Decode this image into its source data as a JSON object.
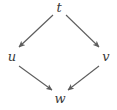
{
  "diagram": {
    "type": "commutative-square",
    "background_color": "#ffffff",
    "stroke_color": "#5d5d5d",
    "label_color": "#3a3a3a",
    "nodes": [
      {
        "id": "t",
        "label": "t",
        "position": "top",
        "x": 59,
        "y": 8
      },
      {
        "id": "u",
        "label": "u",
        "position": "left",
        "x": 12,
        "y": 57
      },
      {
        "id": "v",
        "label": "v",
        "position": "right",
        "x": 106,
        "y": 57
      },
      {
        "id": "w",
        "label": "w",
        "position": "bottom",
        "x": 60,
        "y": 99
      }
    ],
    "edges": [
      {
        "from": "t",
        "to": "u",
        "arrowhead": "to",
        "label": ""
      },
      {
        "from": "t",
        "to": "v",
        "arrowhead": "to",
        "label": ""
      },
      {
        "from": "u",
        "to": "w",
        "arrowhead": "to",
        "label": ""
      },
      {
        "from": "v",
        "to": "w",
        "arrowhead": "to",
        "label": ""
      }
    ]
  }
}
